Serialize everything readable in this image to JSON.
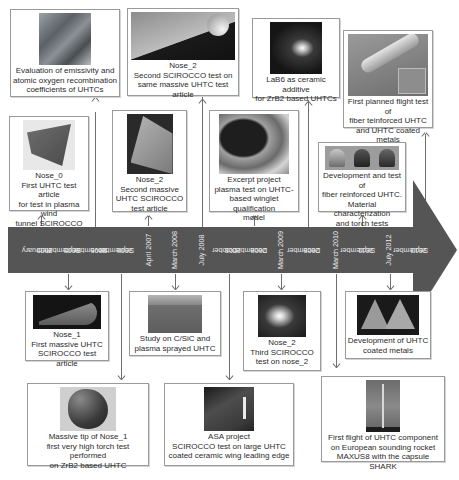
{
  "diagram": {
    "type": "timeline",
    "title": "",
    "colors": {
      "timeline_fill": "#555555",
      "timeline_text": "#e8e8e8",
      "connector": "#6e6e6e",
      "card_border": "#9a9a9a"
    },
    "dates": [
      "February 2005",
      "September 2005",
      "November 2005",
      "September 2006",
      "April 2007",
      "March 2008",
      "July 2008",
      "October 2008",
      "December 2008",
      "March 2009",
      "December 2009",
      "March 2010",
      "September 2011",
      "July 2012",
      "September 2013"
    ],
    "date_labels": [
      {
        "l1": "February",
        "l2": "2005"
      },
      {
        "l1": "September",
        "l2": "2005"
      },
      {
        "l1": "November",
        "l2": "2005"
      },
      {
        "l1": "September",
        "l2": "2006"
      },
      {
        "l1": "April 2007",
        "l2": ""
      },
      {
        "l1": "March 2008",
        "l2": ""
      },
      {
        "l1": "July 2008",
        "l2": ""
      },
      {
        "l1": "October",
        "l2": "2008"
      },
      {
        "l1": "December",
        "l2": "2008"
      },
      {
        "l1": "March 2009",
        "l2": ""
      },
      {
        "l1": "December",
        "l2": "2009"
      },
      {
        "l1": "March 2010",
        "l2": ""
      },
      {
        "l1": "September",
        "l2": "2011"
      },
      {
        "l1": "July 2012",
        "l2": ""
      },
      {
        "l1": "September",
        "l2": "2013"
      }
    ],
    "events_above": [
      {
        "date": "November 2005",
        "image": "vacuum-chamber-photo",
        "lines": [
          "Evaluation of emissivity and",
          "atomic oxygen recombination",
          "coefficients of UHTCs"
        ]
      },
      {
        "date": "July 2008",
        "image": "nose-plasma-test-photo",
        "lines": [
          "Nose_2",
          "Second SCIROCCO test on",
          "same massive UHTC test article"
        ]
      },
      {
        "date": "December 2009",
        "image": "lab6-plasma-photo",
        "lines": [
          "LaB6 as ceramic additive",
          "for ZrB2 based UHTCs"
        ]
      },
      {
        "date": "September 2013",
        "image": "flight-vehicle-render",
        "lines": [
          "First planned flight test of",
          "fiber teinforced UHTC",
          "and UHTC coated metals"
        ]
      },
      {
        "date": "February 2005",
        "image": "nose-0-cone-photo",
        "lines": [
          "Nose_0",
          "First UHTC test article",
          "for test in plasma wind",
          "tunnel SCIROCCO"
        ]
      },
      {
        "date": "April 2007",
        "image": "nose-2-cone-photo",
        "lines": [
          "Nose_2",
          "Second massive",
          "UHTC SCIROCCO",
          "test article"
        ]
      },
      {
        "date": "December 2008",
        "image": "winglet-test-photo",
        "lines": [
          "Excerpt project",
          "plasma test on UHTC-",
          "based winglet qualification",
          "model"
        ]
      },
      {
        "date": "September 2011",
        "image": "three-samples-photo",
        "lines": [
          "Development and test of",
          "fiber reinforced UHTC.",
          "Material characterization",
          "and torch tests"
        ]
      }
    ],
    "events_below": [
      {
        "date": "September 2005",
        "image": "nose-1-photo",
        "lines": [
          "Nose_1",
          "First massive UHTC",
          "SCIROCCO test article"
        ]
      },
      {
        "date": "March 2008",
        "image": "csic-coating-photo",
        "lines": [
          "Study on C/SiC and",
          "plasma sprayed UHTC"
        ]
      },
      {
        "date": "March 2009",
        "image": "nose-2-third-test-photo",
        "lines": [
          "Nose_2",
          "Third SCIROCCO",
          "test on nose_2"
        ]
      },
      {
        "date": "July 2012",
        "image": "coated-cones-photo",
        "lines": [
          "Development of UHTC",
          "coated metals"
        ]
      },
      {
        "date": "September 2006",
        "image": "massive-tip-photo",
        "lines": [
          "Massive tip of Nose_1",
          "first very high torch test performed",
          "on ZrB2 based UHTC"
        ]
      },
      {
        "date": "October 2008",
        "image": "wing-leading-edge-photo",
        "lines": [
          "ASA project",
          "SCIROCCO test on large UHTC",
          "coated ceramic wing leading edge"
        ]
      },
      {
        "date": "March 2010",
        "image": "rocket-launch-photo",
        "lines": [
          "First flight of UHTC component",
          "on European sounding rocket",
          "MAXUS8 with the capsule SHARK"
        ]
      }
    ]
  }
}
